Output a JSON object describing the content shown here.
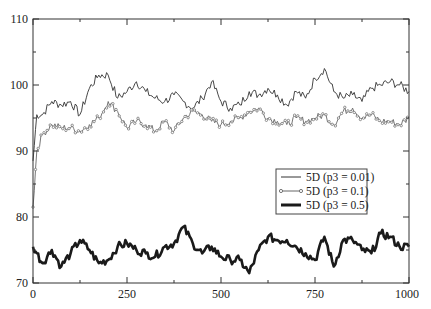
{
  "chart_data": {
    "type": "line",
    "title": "",
    "xlabel": "",
    "ylabel": "",
    "xlim": [
      0,
      1000
    ],
    "ylim": [
      70,
      110
    ],
    "grid": false,
    "legend_position": "right-middle (inside plot)",
    "x_ticks": [
      0,
      250,
      500,
      750,
      1000
    ],
    "x_tick_labels": [
      "0",
      "250",
      "500",
      "750",
      "1000"
    ],
    "y_ticks": [
      70,
      80,
      90,
      100,
      110
    ],
    "y_tick_labels": [
      "70",
      "80",
      "90",
      "100",
      "110"
    ],
    "x": [
      0,
      10,
      25,
      50,
      75,
      100,
      125,
      150,
      175,
      200,
      225,
      250,
      275,
      300,
      325,
      350,
      375,
      400,
      425,
      450,
      475,
      500,
      525,
      550,
      575,
      600,
      625,
      650,
      675,
      700,
      725,
      750,
      775,
      800,
      825,
      850,
      875,
      900,
      925,
      950,
      975,
      1000
    ],
    "series": [
      {
        "name": "5D (p3 = 0.01)",
        "style": "thin line",
        "color": "#333333",
        "values": [
          88.5,
          95.5,
          95.5,
          97.5,
          97.0,
          97.5,
          95.5,
          99.5,
          101.5,
          101.5,
          98.0,
          99.0,
          100.5,
          99.0,
          98.0,
          97.5,
          98.5,
          97.5,
          96.5,
          98.0,
          100.5,
          97.5,
          96.5,
          97.0,
          99.0,
          98.5,
          99.5,
          98.5,
          97.0,
          99.0,
          98.0,
          101.0,
          102.5,
          99.0,
          98.0,
          98.5,
          97.5,
          99.5,
          100.0,
          100.5,
          100.0,
          99.0
        ]
      },
      {
        "name": "5D (p3 = 0.1)",
        "style": "line with small circle markers",
        "color": "#666666",
        "values": [
          81.5,
          90.0,
          92.5,
          94.0,
          93.5,
          93.5,
          93.0,
          94.0,
          95.0,
          97.5,
          96.0,
          93.5,
          94.5,
          94.0,
          93.0,
          94.5,
          93.0,
          95.0,
          96.0,
          95.5,
          94.5,
          94.0,
          94.5,
          95.0,
          96.0,
          96.5,
          95.0,
          94.5,
          94.0,
          95.0,
          94.5,
          95.0,
          95.5,
          94.0,
          96.0,
          96.5,
          95.0,
          95.5,
          94.5,
          94.5,
          94.0,
          95.0
        ]
      },
      {
        "name": "5D (p3 = 0.5)",
        "style": "thick line",
        "color": "#1a1a1a",
        "values": [
          75.5,
          74.5,
          73.0,
          75.0,
          72.5,
          74.5,
          76.5,
          75.0,
          73.0,
          73.5,
          75.5,
          76.0,
          75.0,
          74.5,
          74.0,
          75.5,
          76.0,
          78.5,
          76.0,
          74.5,
          75.5,
          74.0,
          73.5,
          73.5,
          71.5,
          75.0,
          77.0,
          76.5,
          76.5,
          75.5,
          74.5,
          73.5,
          77.0,
          72.5,
          76.5,
          76.5,
          75.0,
          74.5,
          77.5,
          77.0,
          75.5,
          75.5
        ]
      }
    ]
  },
  "legend": {
    "entries": [
      {
        "label": "5D (p3 = 0.01)"
      },
      {
        "label": "5D (p3 = 0.1)"
      },
      {
        "label": "5D (p3 = 0.5)"
      }
    ]
  },
  "axes": {
    "x_tick_labels": [
      "0",
      "250",
      "500",
      "750",
      "1000"
    ],
    "y_tick_labels": [
      "70",
      "80",
      "90",
      "100",
      "110"
    ]
  }
}
